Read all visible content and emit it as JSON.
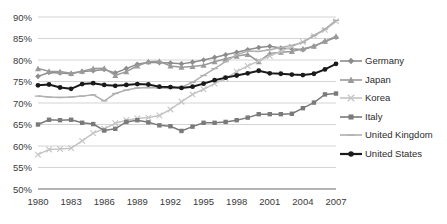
{
  "chart_data": {
    "type": "line",
    "title": "",
    "xlabel": "",
    "ylabel": "",
    "xlim": [
      1980,
      2007
    ],
    "ylim": [
      50,
      90
    ],
    "ytick_labels": [
      "90%",
      "85%",
      "80%",
      "75%",
      "70%",
      "65%",
      "60%",
      "55%",
      "50%"
    ],
    "ytick_values": [
      90,
      85,
      80,
      75,
      70,
      65,
      60,
      55,
      50
    ],
    "xtick_labels": [
      "1980",
      "1983",
      "1986",
      "1989",
      "1992",
      "1995",
      "1998",
      "2001",
      "2004",
      "2007"
    ],
    "xtick_values": [
      1980,
      1983,
      1986,
      1989,
      1992,
      1995,
      1998,
      2001,
      2004,
      2007
    ],
    "x": [
      1980,
      1981,
      1982,
      1983,
      1984,
      1985,
      1986,
      1987,
      1988,
      1989,
      1990,
      1991,
      1992,
      1993,
      1994,
      1995,
      1996,
      1997,
      1998,
      1999,
      2000,
      2001,
      2002,
      2003,
      2004,
      2005,
      2006,
      2007
    ],
    "grid": true,
    "legend_position": "right",
    "series": [
      {
        "name": "Germany",
        "marker": "diamond",
        "color": "#8c8c8c",
        "values": [
          76.2,
          77.1,
          77.0,
          76.8,
          77.3,
          77.5,
          77.8,
          77.0,
          78.0,
          79.0,
          79.5,
          79.4,
          79.3,
          79.1,
          79.5,
          80.0,
          80.6,
          81.2,
          81.8,
          82.4,
          82.9,
          83.2,
          82.8,
          82.6,
          82.4,
          83.2,
          84.3,
          85.3
        ]
      },
      {
        "name": "Japan",
        "marker": "triangle",
        "color": "#9a9a9a",
        "values": [
          78.0,
          77.4,
          77.3,
          76.9,
          77.4,
          78.0,
          78.1,
          76.4,
          77.3,
          78.6,
          79.6,
          79.7,
          78.6,
          78.3,
          78.5,
          78.8,
          79.6,
          80.3,
          80.9,
          81.3,
          79.6,
          81.5,
          81.8,
          82.0,
          82.6,
          83.2,
          84.4,
          85.5
        ]
      },
      {
        "name": "Korea",
        "marker": "cross",
        "color": "#c4c4c4",
        "values": [
          58.0,
          59.2,
          59.3,
          59.5,
          61.2,
          63.0,
          64.0,
          65.3,
          66.0,
          66.4,
          66.6,
          67.1,
          68.5,
          70.3,
          72.0,
          73.2,
          74.5,
          75.7,
          77.3,
          78.6,
          79.8,
          80.9,
          82.0,
          83.1,
          84.2,
          85.6,
          87.0,
          89.0
        ]
      },
      {
        "name": "Italy",
        "marker": "square",
        "color": "#7a7a7a",
        "values": [
          65.0,
          66.1,
          66.0,
          66.1,
          65.4,
          65.1,
          63.6,
          64.0,
          65.6,
          66.0,
          65.5,
          64.8,
          64.6,
          63.5,
          64.5,
          65.4,
          65.4,
          65.6,
          66.0,
          66.6,
          67.4,
          67.4,
          67.4,
          67.5,
          68.8,
          70.1,
          72.0,
          72.2
        ]
      },
      {
        "name": "United Kingdom",
        "marker": "dash",
        "color": "#b0b0b0",
        "values": [
          71.6,
          71.4,
          71.3,
          71.4,
          71.6,
          71.9,
          70.5,
          72.2,
          73.0,
          73.5,
          73.6,
          73.5,
          73.4,
          73.7,
          74.8,
          76.4,
          78.0,
          79.6,
          81.2,
          82.1,
          82.0,
          82.4,
          82.9,
          83.4,
          84.1,
          85.7,
          87.2,
          89.2
        ]
      },
      {
        "name": "United States",
        "marker": "circle",
        "color": "#1a1a1a",
        "values": [
          74.1,
          74.3,
          73.6,
          73.3,
          74.4,
          74.6,
          74.2,
          74.0,
          74.2,
          74.4,
          74.3,
          73.8,
          73.7,
          73.5,
          73.8,
          74.5,
          75.3,
          75.9,
          76.4,
          76.9,
          77.5,
          76.9,
          76.8,
          76.6,
          76.5,
          76.8,
          77.8,
          79.1
        ]
      }
    ]
  },
  "legend": {
    "items": [
      {
        "label": "Germany"
      },
      {
        "label": "Japan"
      },
      {
        "label": "Korea"
      },
      {
        "label": "Italy"
      },
      {
        "label": "United Kingdom"
      },
      {
        "label": "United States"
      }
    ]
  }
}
